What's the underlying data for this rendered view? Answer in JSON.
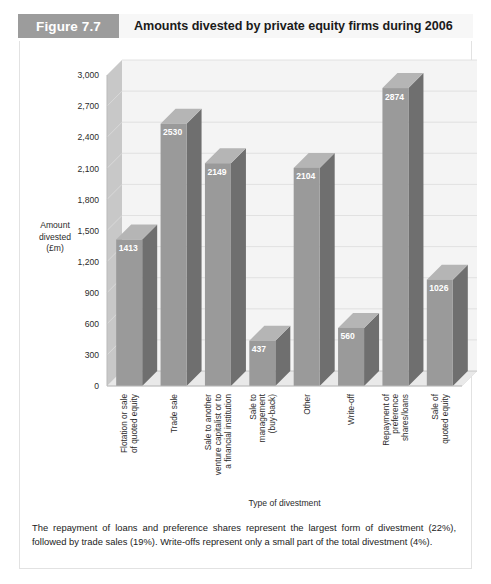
{
  "header": {
    "figure_tag": "Figure 7.7",
    "title": "Amounts divested by private equity firms during 2006"
  },
  "chart_data": {
    "type": "bar",
    "title": "Amounts divested by private equity firms during 2006",
    "xlabel": "Type of divestment",
    "ylabel": "Amount divested (£m)",
    "ylabel_lines": [
      "Amount",
      "divested",
      "(£m)"
    ],
    "ylim": [
      0,
      3000
    ],
    "ytick_step": 300,
    "ytick_labels": [
      "0",
      "300",
      "600",
      "900",
      "1,200",
      "1,500",
      "1,800",
      "2,100",
      "2,400",
      "2,700",
      "3,000"
    ],
    "grid": true,
    "legend": "none",
    "categories": [
      "Flotation or sale of quoted equity",
      "Trade sale",
      "Sale to another venture capitalist or to a financial institution",
      "Sale to management (buy-back)",
      "Other",
      "Write-off",
      "Repayment of preference shares/loans",
      "Sale of quoted equity"
    ],
    "category_lines": [
      [
        "Flotation or sale",
        "of quoted equity"
      ],
      [
        "Trade sale"
      ],
      [
        "Sale to another",
        "venture capitalist or to",
        "a financial institution"
      ],
      [
        "Sale to",
        "management",
        "(buy-back)"
      ],
      [
        "Other"
      ],
      [
        "Write-off"
      ],
      [
        "Repayment of",
        "preference",
        "shares/loans"
      ],
      [
        "Sale of",
        "quoted equity"
      ]
    ],
    "values": [
      1413,
      2530,
      2149,
      437,
      2104,
      560,
      2874,
      1026
    ],
    "value_labels": [
      "1413",
      "2530",
      "2149",
      "437",
      "2104",
      "560",
      "2874",
      "1026"
    ]
  },
  "colors": {
    "tag_background": "#9c9c9c",
    "header_background": "#f7f7f7",
    "bar_front": "#9a9a9a",
    "bar_side": "#6f6f6f",
    "bar_top": "#b5b5b5",
    "plot_background": "#f4f4f4",
    "wall": "#c8c8c8",
    "gridline": "#dcdcdc"
  },
  "caption": {
    "text": "The repayment of loans and preference shares represent the largest form of divestment (22%), followed by trade sales (19%). Write-offs represent only a small part of the total divestment (4%)."
  }
}
